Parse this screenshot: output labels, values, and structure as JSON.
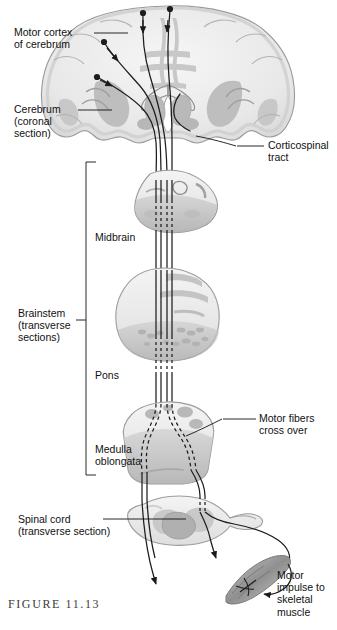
{
  "figure": {
    "caption": "FIGURE 11.13",
    "background": "#ffffff",
    "ink": "#111111"
  },
  "labels": {
    "motor_cortex": "Motor cortex\nof cerebrum",
    "cerebrum": "Cerebrum\n(coronal\nsection)",
    "corticospinal_tract": "Corticospinal\ntract",
    "brainstem": "Brainstem\n(transverse\nsections)",
    "midbrain": "Midbrain",
    "pons": "Pons",
    "medulla": "Medulla\noblongata",
    "spinal_cord": "Spinal cord\n(transverse section)",
    "motor_fibers_cross": "Motor fibers\ncross over",
    "motor_impulse": "Motor\nimpulse to\nskeletal\nmuscle"
  },
  "structures": [
    {
      "name": "cerebrum-coronal-section",
      "region": "cerebrum"
    },
    {
      "name": "midbrain-section",
      "region": "brainstem"
    },
    {
      "name": "pons-section",
      "region": "brainstem"
    },
    {
      "name": "medulla-oblongata-section",
      "region": "brainstem"
    },
    {
      "name": "spinal-cord-section",
      "region": "spinal cord"
    },
    {
      "name": "skeletal-muscle-fiber",
      "region": "effector"
    }
  ],
  "palette": {
    "tissue_light": "#f0f0f0",
    "tissue_mid": "#dcdcdc",
    "tissue_gray": "#bdbdbd",
    "tissue_dark": "#a3a3a3",
    "outline": "#8d8d8d",
    "tract": "#1a1a1a",
    "leader": "#111111"
  }
}
